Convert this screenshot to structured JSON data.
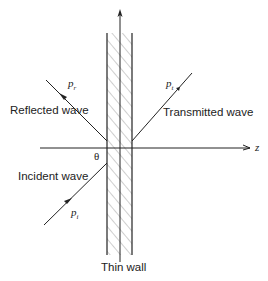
{
  "diagram": {
    "labels": {
      "reflected": "Reflected wave",
      "transmitted": "Transmitted wave",
      "incident": "Incident wave",
      "wall": "Thin wall",
      "angle": "θ",
      "axis": "z"
    },
    "symbols": {
      "reflected": {
        "base": "p",
        "sub": "r"
      },
      "transmitted": {
        "base": "p",
        "sub": "t"
      },
      "incident": {
        "base": "p",
        "sub": "i"
      }
    },
    "colors": {
      "line": "#222222",
      "hatch": "#9a9a9a"
    }
  }
}
